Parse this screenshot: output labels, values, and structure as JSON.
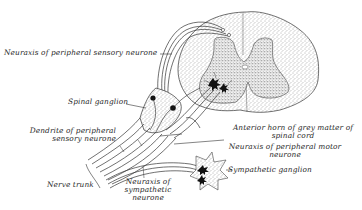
{
  "figure": {
    "colors": {
      "ink": "#2a2a2a",
      "background": "#ffffff",
      "stipple_light": "#d9d9d9",
      "stipple_dark": "#bdbdbd"
    }
  },
  "labels": {
    "neuraxis_sensory": "Neuraxis of peripheral sensory neurone",
    "spinal_ganglion": "Spinal ganglion",
    "dendrite_line1": "Dendrite of peripheral",
    "dendrite_line2": "sensory neurone",
    "nerve_trunk": "Nerve trunk",
    "neuraxis_sympathetic_line1": "Neuraxis of",
    "neuraxis_sympathetic_line2": "sympathetic",
    "neuraxis_sympathetic_line3": "neurone",
    "anterior_horn_line1": "Anterior horn of grey matter of",
    "anterior_horn_line2": "spinal cord",
    "neuraxis_motor_line1": "Neuraxis of peripheral motor",
    "neuraxis_motor_line2": "neurone",
    "sympathetic_ganglion": "Sympathetic ganglion"
  }
}
